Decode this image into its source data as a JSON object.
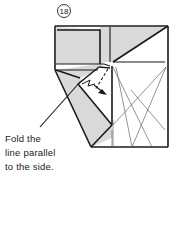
{
  "step": {
    "number": "18"
  },
  "instruction": {
    "lines": [
      "Fold the",
      "line parallel",
      "to the side."
    ]
  },
  "colors": {
    "shade": "#d9d9d9",
    "line": "#1a1a1a",
    "thin_line": "#555555"
  }
}
